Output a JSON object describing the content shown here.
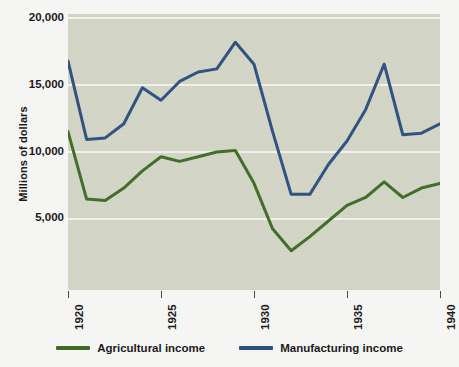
{
  "chart_data": {
    "type": "line",
    "title": "",
    "xlabel": "",
    "ylabel": "Millions of dollars",
    "xlim": [
      1920,
      1940
    ],
    "ylim": [
      2400,
      20000
    ],
    "yticks": [
      "20,000",
      "15,000",
      "10,000",
      "5,000"
    ],
    "ytick_values": [
      20000,
      15000,
      10000,
      5000
    ],
    "xticks": [
      "1920",
      "1925",
      "1930",
      "1935",
      "1940"
    ],
    "xtick_values": [
      1920,
      1925,
      1930,
      1935,
      1940
    ],
    "grid": "horizontal",
    "grid_color": "#f2f3ee",
    "plot_background": "#d3d5c6",
    "figure_background": "#f5f5f3",
    "legend_position": "bottom-center",
    "x": [
      1920,
      1921,
      1922,
      1923,
      1924,
      1925,
      1926,
      1927,
      1928,
      1929,
      1930,
      1931,
      1932,
      1933,
      1934,
      1935,
      1936,
      1937,
      1938,
      1939,
      1940
    ],
    "series": [
      {
        "name": "Agricultural income",
        "color": "#3d6b23",
        "values": [
          12500,
          8200,
          8100,
          8900,
          10000,
          10900,
          10600,
          10900,
          11200,
          11300,
          9200,
          6300,
          4900,
          5800,
          6800,
          7800,
          8300,
          9300,
          8300,
          8900,
          9200
        ]
      },
      {
        "name": "Manufacturing income",
        "color": "#2b4f7e",
        "values": [
          17000,
          12000,
          12100,
          13000,
          15300,
          14500,
          15700,
          16300,
          16500,
          18200,
          16800,
          12500,
          8500,
          8500,
          10400,
          11900,
          13900,
          16800,
          12300,
          12400,
          13000
        ]
      }
    ]
  },
  "legend": {
    "items": [
      {
        "label": "Agricultural income",
        "color": "#3d6b23"
      },
      {
        "label": "Manufacturing income",
        "color": "#2b4f7e"
      }
    ]
  }
}
